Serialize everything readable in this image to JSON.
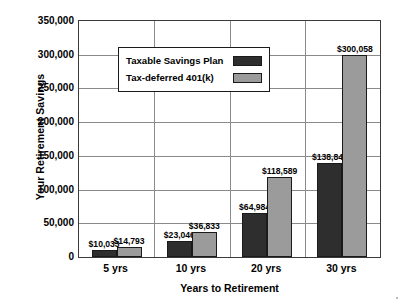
{
  "chart_data": {
    "type": "bar",
    "title": "",
    "xlabel": "Years to Retirement",
    "ylabel": "Your Retirement Savings",
    "categories": [
      "5 yrs",
      "10 yrs",
      "20 yrs",
      "30 yrs"
    ],
    "ylim": [
      0,
      350000
    ],
    "ytick_values": [
      0,
      50000,
      100000,
      150000,
      200000,
      250000,
      300000,
      350000
    ],
    "ytick_labels": [
      "0",
      "50,000",
      "100,000",
      "150,000",
      "200,000",
      "250,000",
      "300,000",
      "350,000"
    ],
    "grid": "horizontal-and-category-dividers",
    "legend_position": "upper-left-inside",
    "series": [
      {
        "name": "Taxable Savings Plan",
        "color": "#2e2e2e",
        "values": [
          10033,
          23046,
          64984,
          138847
        ],
        "data_labels": [
          "$10,033",
          "$23,046",
          "$64,984",
          "$138,847"
        ]
      },
      {
        "name": "Tax-deferred 401(k)",
        "color": "#9b9b9b",
        "values": [
          14793,
          36833,
          118589,
          300058
        ],
        "data_labels": [
          "$14,793",
          "$36,833",
          "$118,589",
          "$300,058"
        ]
      }
    ]
  }
}
